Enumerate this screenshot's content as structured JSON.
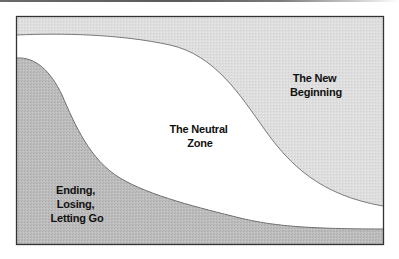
{
  "diagram": {
    "regions": [
      {
        "id": "ending",
        "lines": [
          "Ending,",
          "Losing,",
          "Letting Go"
        ],
        "fill": "#b9b9b9"
      },
      {
        "id": "neutral",
        "lines": [
          "The Neutral",
          "Zone"
        ],
        "fill": "#ffffff"
      },
      {
        "id": "new-beginning",
        "lines": [
          "The New",
          "Beginning"
        ],
        "fill": "#dcdcdc"
      }
    ],
    "frame_color": "#333333",
    "curve_color": "#777777"
  }
}
